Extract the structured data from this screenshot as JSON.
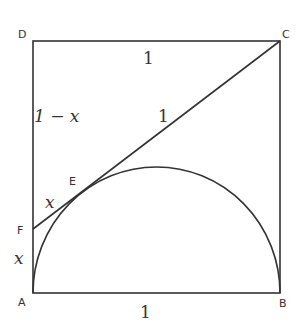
{
  "diagram": {
    "points": {
      "A": "A",
      "B": "B",
      "C": "C",
      "D": "D",
      "E": "E",
      "F": "F"
    },
    "labels": {
      "top_side": "1",
      "bottom_side": "1",
      "dc_segment": "1 − x",
      "ec_segment": "1",
      "fe_segment": "x",
      "af_segment": "x"
    },
    "colors": {
      "stroke": "#333333",
      "background": "#ffffff"
    }
  }
}
